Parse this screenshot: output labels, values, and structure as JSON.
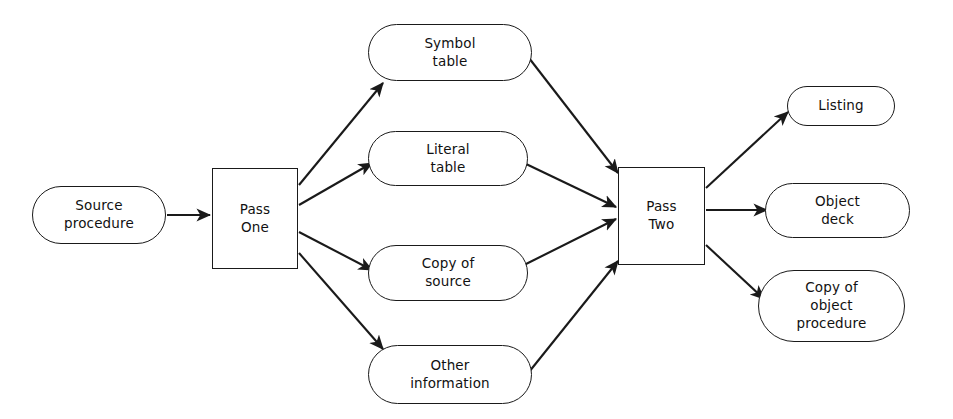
{
  "diagram": {
    "stroke_color": "#1a1a1a",
    "text_color": "#111111",
    "background_color": "#ffffff",
    "nodes": {
      "source_procedure": {
        "label": "Source\nprocedure",
        "shape": "pill"
      },
      "pass_one": {
        "label": "Pass\nOne",
        "shape": "rectangle"
      },
      "symbol_table": {
        "label": "Symbol\ntable",
        "shape": "pill"
      },
      "literal_table": {
        "label": "Literal\ntable",
        "shape": "pill"
      },
      "copy_of_source": {
        "label": "Copy of\nsource",
        "shape": "pill"
      },
      "other_information": {
        "label": "Other\ninformation",
        "shape": "pill"
      },
      "pass_two": {
        "label": "Pass\nTwo",
        "shape": "rectangle"
      },
      "listing": {
        "label": "Listing",
        "shape": "pill"
      },
      "object_deck": {
        "label": "Object\ndeck",
        "shape": "pill"
      },
      "copy_of_object_procedure": {
        "label": "Copy of\nobject\nprocedure",
        "shape": "pill"
      }
    },
    "edges": [
      {
        "from": "source_procedure",
        "to": "pass_one"
      },
      {
        "from": "pass_one",
        "to": "symbol_table"
      },
      {
        "from": "pass_one",
        "to": "literal_table"
      },
      {
        "from": "pass_one",
        "to": "copy_of_source"
      },
      {
        "from": "pass_one",
        "to": "other_information"
      },
      {
        "from": "symbol_table",
        "to": "pass_two"
      },
      {
        "from": "literal_table",
        "to": "pass_two"
      },
      {
        "from": "copy_of_source",
        "to": "pass_two"
      },
      {
        "from": "other_information",
        "to": "pass_two"
      },
      {
        "from": "pass_two",
        "to": "listing"
      },
      {
        "from": "pass_two",
        "to": "object_deck"
      },
      {
        "from": "pass_two",
        "to": "copy_of_object_procedure"
      }
    ]
  }
}
